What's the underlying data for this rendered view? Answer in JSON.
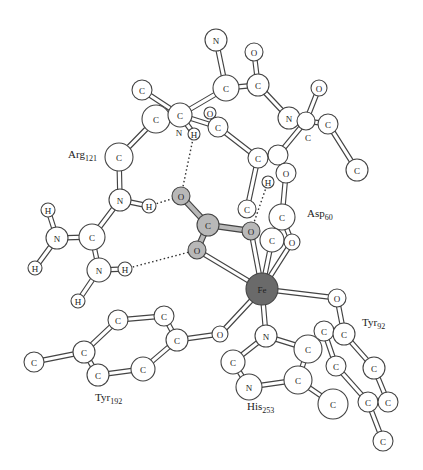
{
  "colors": {
    "background": "#ffffff",
    "atom_fill": "#ffffff",
    "ligand_fill": "#b8b8b8",
    "metal_fill": "#6a6a6a",
    "stroke": "#444444"
  },
  "residues": [
    {
      "name": "Arg",
      "number": "121",
      "x": 68,
      "y": 158
    },
    {
      "name": "Asp",
      "number": "60",
      "x": 307,
      "y": 217
    },
    {
      "name": "Tyr",
      "number": "92",
      "x": 362,
      "y": 326
    },
    {
      "name": "Tyr",
      "number": "192",
      "x": 95,
      "y": 401
    },
    {
      "name": "His",
      "number": "253",
      "x": 247,
      "y": 410
    }
  ],
  "atoms": [
    {
      "id": "a1",
      "el": "N",
      "x": 216,
      "y": 40,
      "r": 11
    },
    {
      "id": "a2",
      "el": "C",
      "x": 226,
      "y": 88,
      "r": 13
    },
    {
      "id": "a3",
      "el": "O",
      "x": 254,
      "y": 52,
      "r": 9
    },
    {
      "id": "a4",
      "el": "C",
      "x": 258,
      "y": 85,
      "r": 11
    },
    {
      "id": "a5",
      "el": "O",
      "x": 319,
      "y": 88,
      "r": 8
    },
    {
      "id": "a6",
      "el": "N",
      "x": 289,
      "y": 118,
      "r": 11
    },
    {
      "id": "a7",
      "el": "",
      "x": 306,
      "y": 121,
      "r": 9
    },
    {
      "id": "a8",
      "el": "C",
      "x": 328,
      "y": 124,
      "r": 10
    },
    {
      "id": "a9",
      "el": "C",
      "x": 357,
      "y": 170,
      "r": 11
    },
    {
      "id": "a10",
      "el": "C",
      "x": 142,
      "y": 90,
      "r": 10
    },
    {
      "id": "a11",
      "el": "C",
      "x": 156,
      "y": 119,
      "r": 14
    },
    {
      "id": "a12",
      "el": "C",
      "x": 180,
      "y": 115,
      "r": 12
    },
    {
      "id": "a13",
      "el": "H",
      "x": 194,
      "y": 134,
      "r": 6
    },
    {
      "id": "a14",
      "el": "O",
      "x": 210,
      "y": 113,
      "r": 6
    },
    {
      "id": "a15",
      "el": "C",
      "x": 218,
      "y": 127,
      "r": 10
    },
    {
      "id": "a16",
      "el": "C",
      "x": 258,
      "y": 158,
      "r": 10
    },
    {
      "id": "a17",
      "el": "",
      "x": 278,
      "y": 155,
      "r": 10
    },
    {
      "id": "a18",
      "el": "O",
      "x": 286,
      "y": 173,
      "r": 10
    },
    {
      "id": "a19",
      "el": "H",
      "x": 268,
      "y": 182,
      "r": 6
    },
    {
      "id": "a20",
      "el": "C",
      "x": 247,
      "y": 209,
      "r": 9
    },
    {
      "id": "a21",
      "el": "C",
      "x": 282,
      "y": 217,
      "r": 13
    },
    {
      "id": "a22",
      "el": "C",
      "x": 272,
      "y": 240,
      "r": 12
    },
    {
      "id": "a23",
      "el": "O",
      "x": 292,
      "y": 242,
      "r": 8
    },
    {
      "id": "a24",
      "el": "C",
      "x": 119,
      "y": 157,
      "r": 14
    },
    {
      "id": "a25",
      "el": "N",
      "x": 120,
      "y": 200,
      "r": 11
    },
    {
      "id": "a26",
      "el": "H",
      "x": 149,
      "y": 206,
      "r": 7
    },
    {
      "id": "a27",
      "el": "C",
      "x": 92,
      "y": 237,
      "r": 13
    },
    {
      "id": "a28",
      "el": "N",
      "x": 57,
      "y": 238,
      "r": 11
    },
    {
      "id": "a29",
      "el": "H",
      "x": 48,
      "y": 210,
      "r": 7
    },
    {
      "id": "a30",
      "el": "H",
      "x": 35,
      "y": 268,
      "r": 7
    },
    {
      "id": "a31",
      "el": "N",
      "x": 99,
      "y": 270,
      "r": 12
    },
    {
      "id": "a32",
      "el": "H",
      "x": 125,
      "y": 269,
      "r": 7
    },
    {
      "id": "a33",
      "el": "H",
      "x": 78,
      "y": 301,
      "r": 7
    },
    {
      "id": "b1",
      "el": "O",
      "x": 181,
      "y": 196,
      "r": 9,
      "kind": "ligand"
    },
    {
      "id": "b2",
      "el": "C",
      "x": 208,
      "y": 225,
      "r": 11,
      "kind": "ligand"
    },
    {
      "id": "b3",
      "el": "O",
      "x": 197,
      "y": 250,
      "r": 9,
      "kind": "ligand"
    },
    {
      "id": "b4",
      "el": "O",
      "x": 251,
      "y": 231,
      "r": 9,
      "kind": "ligand"
    },
    {
      "id": "fe",
      "el": "Fe",
      "x": 262,
      "y": 289,
      "r": 16,
      "kind": "metal"
    },
    {
      "id": "c1",
      "el": "O",
      "x": 337,
      "y": 298,
      "r": 9
    },
    {
      "id": "c2",
      "el": "C",
      "x": 324,
      "y": 331,
      "r": 10
    },
    {
      "id": "c3",
      "el": "C",
      "x": 344,
      "y": 334,
      "r": 11
    },
    {
      "id": "c4",
      "el": "C",
      "x": 336,
      "y": 366,
      "r": 10
    },
    {
      "id": "c5",
      "el": "C",
      "x": 374,
      "y": 368,
      "r": 11
    },
    {
      "id": "c6",
      "el": "C",
      "x": 368,
      "y": 402,
      "r": 10
    },
    {
      "id": "c7",
      "el": "C",
      "x": 388,
      "y": 402,
      "r": 10
    },
    {
      "id": "c8",
      "el": "C",
      "x": 383,
      "y": 441,
      "r": 10
    },
    {
      "id": "d1",
      "el": "N",
      "x": 266,
      "y": 336,
      "r": 11
    },
    {
      "id": "d2",
      "el": "C",
      "x": 308,
      "y": 349,
      "r": 14
    },
    {
      "id": "d3",
      "el": "C",
      "x": 233,
      "y": 362,
      "r": 12
    },
    {
      "id": "d4",
      "el": "N",
      "x": 249,
      "y": 387,
      "r": 13
    },
    {
      "id": "d5",
      "el": "C",
      "x": 298,
      "y": 380,
      "r": 14
    },
    {
      "id": "d6",
      "el": "C",
      "x": 333,
      "y": 404,
      "r": 15
    },
    {
      "id": "e1",
      "el": "O",
      "x": 220,
      "y": 334,
      "r": 8
    },
    {
      "id": "e2",
      "el": "C",
      "x": 177,
      "y": 340,
      "r": 11
    },
    {
      "id": "e3",
      "el": "C",
      "x": 164,
      "y": 316,
      "r": 10
    },
    {
      "id": "e4",
      "el": "C",
      "x": 118,
      "y": 320,
      "r": 10
    },
    {
      "id": "e5",
      "el": "C",
      "x": 84,
      "y": 352,
      "r": 11
    },
    {
      "id": "e6",
      "el": "C",
      "x": 98,
      "y": 375,
      "r": 11
    },
    {
      "id": "e7",
      "el": "C",
      "x": 143,
      "y": 369,
      "r": 12
    },
    {
      "id": "e8",
      "el": "C",
      "x": 34,
      "y": 362,
      "r": 10
    }
  ],
  "bonds": [
    [
      "a1",
      "a2"
    ],
    [
      "a2",
      "a4"
    ],
    [
      "a3",
      "a4"
    ],
    [
      "a4",
      "a6"
    ],
    [
      "a6",
      "a7"
    ],
    [
      "a5",
      "a7"
    ],
    [
      "a7",
      "a8"
    ],
    [
      "a8",
      "a9"
    ],
    [
      "a7",
      "a17"
    ],
    [
      "a2",
      "a12"
    ],
    [
      "a10",
      "a12"
    ],
    [
      "a11",
      "a12"
    ],
    [
      "a11",
      "a24"
    ],
    [
      "a12",
      "a13"
    ],
    [
      "a12",
      "a15"
    ],
    [
      "a14",
      "a15"
    ],
    [
      "a15",
      "a16"
    ],
    [
      "a16",
      "a17"
    ],
    [
      "a16",
      "a20"
    ],
    [
      "a17",
      "a18"
    ],
    [
      "a18",
      "a21"
    ],
    [
      "a21",
      "a22"
    ],
    [
      "a21",
      "a23"
    ],
    [
      "a24",
      "a25"
    ],
    [
      "a25",
      "a26"
    ],
    [
      "a25",
      "a27"
    ],
    [
      "a27",
      "a28"
    ],
    [
      "a28",
      "a29"
    ],
    [
      "a28",
      "a30"
    ],
    [
      "a27",
      "a31"
    ],
    [
      "a31",
      "a32"
    ],
    [
      "a31",
      "a33"
    ],
    [
      "fe",
      "b3"
    ],
    [
      "fe",
      "b4"
    ],
    [
      "fe",
      "a22"
    ],
    [
      "fe",
      "a23"
    ],
    [
      "fe",
      "c1"
    ],
    [
      "fe",
      "d1"
    ],
    [
      "fe",
      "e1"
    ],
    [
      "c1",
      "c3"
    ],
    [
      "c2",
      "c3"
    ],
    [
      "c2",
      "c4"
    ],
    [
      "c3",
      "c5"
    ],
    [
      "c4",
      "c6"
    ],
    [
      "c5",
      "c7"
    ],
    [
      "c6",
      "c7"
    ],
    [
      "c6",
      "c8"
    ],
    [
      "d1",
      "d2"
    ],
    [
      "d1",
      "d3"
    ],
    [
      "d3",
      "d4"
    ],
    [
      "d4",
      "d5"
    ],
    [
      "d2",
      "d5"
    ],
    [
      "d5",
      "d6"
    ],
    [
      "e1",
      "e2"
    ],
    [
      "e2",
      "e3"
    ],
    [
      "e3",
      "e4"
    ],
    [
      "e4",
      "e5"
    ],
    [
      "e5",
      "e6"
    ],
    [
      "e6",
      "e7"
    ],
    [
      "e7",
      "e2"
    ],
    [
      "e5",
      "e8"
    ]
  ],
  "ligand_bonds": [
    [
      "b1",
      "b2"
    ],
    [
      "b2",
      "b3"
    ],
    [
      "b2",
      "b4"
    ]
  ],
  "hbonds": [
    [
      "a13",
      "b1"
    ],
    [
      "a26",
      "b1"
    ],
    [
      "a32",
      "b3"
    ],
    [
      "a19",
      "b4"
    ]
  ]
}
